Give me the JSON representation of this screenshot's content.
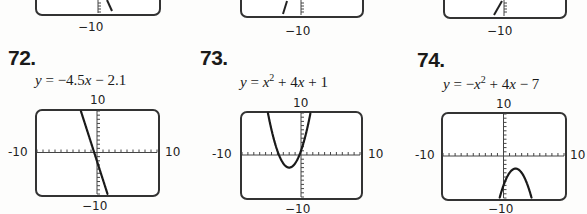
{
  "top_row": {
    "partial_graphs": [
      {
        "ymin_label": "−10",
        "curve": "decreasing-line"
      },
      {
        "ymin_label": "−10",
        "curve": "increasing-line"
      },
      {
        "ymin_label": "−10",
        "curve": "increasing-line"
      }
    ]
  },
  "exercises": [
    {
      "number": "72.",
      "equation_text": "y = −4.5x − 2.1",
      "equation_parts": [
        "y",
        " = −4.5",
        "x",
        " − 2.1"
      ],
      "window": {
        "xmin": -10,
        "xmax": 10,
        "ymin": -10,
        "ymax": 10
      },
      "labels": {
        "top": "10",
        "bottom": "−10",
        "left": "-10",
        "right": "10"
      }
    },
    {
      "number": "73.",
      "equation_text": "y = x² + 4x + 1",
      "equation_parts": [
        "y",
        " = ",
        "x",
        "2",
        " + 4",
        "x",
        " + 1"
      ],
      "window": {
        "xmin": -10,
        "xmax": 10,
        "ymin": -10,
        "ymax": 10
      },
      "labels": {
        "top": "10",
        "bottom": "−10",
        "left": "-10",
        "right": "10"
      }
    },
    {
      "number": "74.",
      "equation_text": "y = −x² + 4x − 7",
      "equation_parts": [
        "y",
        " = −",
        "x",
        "2",
        " + 4",
        "x",
        " − 7"
      ],
      "window": {
        "xmin": -10,
        "xmax": 10,
        "ymin": -10,
        "ymax": 10
      },
      "labels": {
        "top": "10",
        "bottom": "−10",
        "left": "-10",
        "right": "10"
      }
    }
  ],
  "chart_data": [
    {
      "type": "line",
      "title": "72. y = −4.5x − 2.1",
      "function": "-4.5*x - 2.1",
      "coefficients": {
        "slope": -4.5,
        "intercept": -2.1
      },
      "xlim": [
        -10,
        10
      ],
      "ylim": [
        -10,
        10
      ],
      "xtick_step": 1,
      "ytick_step": 1,
      "tick_labels": {
        "xmin": "-10",
        "xmax": "10",
        "ymin": "−10",
        "ymax": "10"
      },
      "grid": false
    },
    {
      "type": "line",
      "title": "73. y = x² + 4x + 1",
      "function": "x^2 + 4x + 1",
      "coefficients": {
        "a": 1,
        "b": 4,
        "c": 1
      },
      "vertex": [
        -2,
        -3
      ],
      "xlim": [
        -10,
        10
      ],
      "ylim": [
        -10,
        10
      ],
      "xtick_step": 1,
      "ytick_step": 1,
      "tick_labels": {
        "xmin": "-10",
        "xmax": "10",
        "ymin": "−10",
        "ymax": "10"
      },
      "grid": false
    },
    {
      "type": "line",
      "title": "74. y = −x² + 4x − 7",
      "function": "-x^2 + 4x - 7",
      "coefficients": {
        "a": -1,
        "b": 4,
        "c": -7
      },
      "vertex": [
        2,
        -3
      ],
      "xlim": [
        -10,
        10
      ],
      "ylim": [
        -10,
        10
      ],
      "xtick_step": 1,
      "ytick_step": 1,
      "tick_labels": {
        "xmin": "-10",
        "xmax": "10",
        "ymin": "−10",
        "ymax": "10"
      },
      "grid": false
    }
  ]
}
